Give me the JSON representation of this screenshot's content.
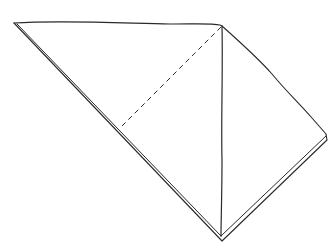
{
  "diagram": {
    "title": "",
    "stroke_color": "#2a2a2a",
    "background": "#ffffff",
    "shapes": {
      "outer_outline": {
        "points": [
          [
            14,
            23
          ],
          [
            222,
            26
          ],
          [
            326,
            136
          ],
          [
            222,
            240
          ],
          [
            14,
            23
          ]
        ]
      },
      "edge_double_left": {
        "points": [
          [
            16,
            27
          ],
          [
            219,
            238
          ]
        ]
      },
      "edge_double_right": {
        "points": [
          [
            324,
            140
          ],
          [
            224,
            238
          ]
        ]
      },
      "vertical_fold": {
        "points": [
          [
            222,
            26
          ],
          [
            221,
            236
          ]
        ]
      },
      "dashed_fold_guide": {
        "points": [
          [
            222,
            26
          ],
          [
            122,
            126
          ]
        ],
        "dash": "5 4"
      }
    }
  }
}
